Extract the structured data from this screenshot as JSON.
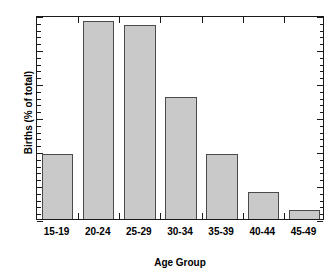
{
  "chart_data": {
    "type": "bar",
    "title": "",
    "subtitle": "",
    "xlabel": "Age Group",
    "ylabel": "Births (% of total)",
    "categories": [
      "15-19",
      "20-24",
      "25-29",
      "30-34",
      "35-39",
      "40-44",
      "45-49"
    ],
    "values": [
      9.6,
      29.1,
      28.5,
      18.0,
      9.5,
      3.9,
      1.3
    ],
    "ylim": [
      0,
      30
    ],
    "yticks": [
      0,
      5,
      10,
      15,
      20,
      25,
      30
    ],
    "ytick_labels": [
      "0",
      "5",
      "10",
      "15",
      "20",
      "25",
      "30"
    ],
    "y_minor_tick_interval": 1,
    "grid": false,
    "legend": null,
    "legend_position": "none",
    "bar_fill_color": "#c9c9c9",
    "bar_edge_color": "#4a4a4a",
    "axis_color": "#1a1a1a",
    "background_color": "#ffffff"
  },
  "axes": {
    "y_title": "Births (% of total)",
    "x_title": "Age Group"
  }
}
